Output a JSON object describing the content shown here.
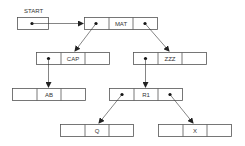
{
  "diagram": {
    "start_label": "START",
    "nodes": [
      {
        "id": "mat",
        "label": "MAT",
        "x": 84,
        "y": 17
      },
      {
        "id": "cap",
        "label": "CAP",
        "x": 36,
        "y": 52
      },
      {
        "id": "zzz",
        "label": "ZZZ",
        "x": 133,
        "y": 52
      },
      {
        "id": "ab",
        "label": "AB",
        "x": 12,
        "y": 88
      },
      {
        "id": "r1",
        "label": "R1",
        "x": 109,
        "y": 88
      },
      {
        "id": "q",
        "label": "Q",
        "x": 60,
        "y": 124
      },
      {
        "id": "x",
        "label": "X",
        "x": 158,
        "y": 124
      }
    ],
    "edges": [
      {
        "from": "START",
        "to": "MAT"
      },
      {
        "from": "MAT.left",
        "to": "CAP"
      },
      {
        "from": "MAT.right",
        "to": "ZZZ"
      },
      {
        "from": "CAP.left",
        "to": "AB"
      },
      {
        "from": "ZZZ.left",
        "to": "R1"
      },
      {
        "from": "R1.left",
        "to": "Q"
      },
      {
        "from": "R1.right",
        "to": "X"
      }
    ],
    "colors": {
      "line": "#555555",
      "dot": "#111111",
      "bg": "#ffffff"
    }
  }
}
